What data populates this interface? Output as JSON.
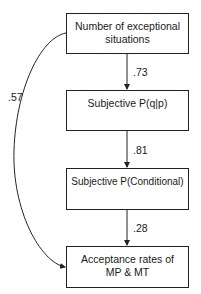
{
  "diagram": {
    "type": "path-diagram",
    "nodes": [
      {
        "id": "n1",
        "label_line1": "Number of exceptional",
        "label_line2": "situations"
      },
      {
        "id": "n2",
        "label_line1": "Subjective P(q|p)",
        "label_line2": ""
      },
      {
        "id": "n3",
        "label_line1": "Subjective P(Conditional)",
        "label_line2": ""
      },
      {
        "id": "n4",
        "label_line1": "Acceptance rates of",
        "label_line2": "MP & MT"
      }
    ],
    "edges": [
      {
        "from": "n1",
        "to": "n2",
        "label": ".73"
      },
      {
        "from": "n2",
        "to": "n3",
        "label": ".81"
      },
      {
        "from": "n3",
        "to": "n4",
        "label": ".28"
      },
      {
        "from": "n1",
        "to": "n4",
        "label": ".57"
      }
    ],
    "colors": {
      "line": "#222222",
      "background": "#ffffff"
    }
  }
}
